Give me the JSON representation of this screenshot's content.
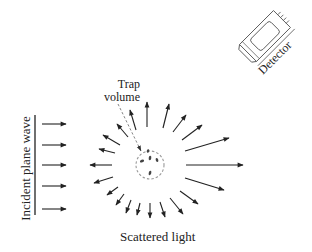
{
  "diagram": {
    "labels": {
      "trap_line1": "Trap",
      "trap_line2": "volume",
      "incident": "Incident plane wave",
      "scattered": "Scattered light",
      "detector": "Detector"
    },
    "colors": {
      "ink": "#222222",
      "dashed": "#888888",
      "background": "#ffffff"
    },
    "trap": {
      "cx": 150,
      "cy": 165,
      "r": 14
    },
    "incident_wave": {
      "wavefront_x": 35,
      "wavefront_y1": 115,
      "wavefront_y2": 215,
      "arrows_y": [
        124,
        145,
        165,
        186,
        209
      ],
      "arrow_x1": 42,
      "arrow_x2": 66
    },
    "scattered_arrows": [
      {
        "x1": 186,
        "y1": 165,
        "x2": 243,
        "y2": 165
      },
      {
        "x1": 185,
        "y1": 151,
        "x2": 229,
        "y2": 138
      },
      {
        "x1": 182,
        "y1": 140,
        "x2": 202,
        "y2": 125
      },
      {
        "x1": 173,
        "y1": 132,
        "x2": 186,
        "y2": 115
      },
      {
        "x1": 163,
        "y1": 128,
        "x2": 169,
        "y2": 104
      },
      {
        "x1": 147,
        "y1": 127,
        "x2": 147,
        "y2": 102
      },
      {
        "x1": 136,
        "y1": 130,
        "x2": 130,
        "y2": 110
      },
      {
        "x1": 128,
        "y1": 137,
        "x2": 117,
        "y2": 124
      },
      {
        "x1": 120,
        "y1": 145,
        "x2": 103,
        "y2": 135
      },
      {
        "x1": 115,
        "y1": 153,
        "x2": 99,
        "y2": 149
      },
      {
        "x1": 112,
        "y1": 165,
        "x2": 90,
        "y2": 165
      },
      {
        "x1": 113,
        "y1": 177,
        "x2": 94,
        "y2": 183
      },
      {
        "x1": 118,
        "y1": 187,
        "x2": 107,
        "y2": 195
      },
      {
        "x1": 124,
        "y1": 194,
        "x2": 116,
        "y2": 205
      },
      {
        "x1": 131,
        "y1": 200,
        "x2": 126,
        "y2": 213
      },
      {
        "x1": 140,
        "y1": 203,
        "x2": 137,
        "y2": 215
      },
      {
        "x1": 150,
        "y1": 203,
        "x2": 150,
        "y2": 218
      },
      {
        "x1": 160,
        "y1": 202,
        "x2": 165,
        "y2": 217
      },
      {
        "x1": 170,
        "y1": 198,
        "x2": 183,
        "y2": 214
      },
      {
        "x1": 180,
        "y1": 191,
        "x2": 198,
        "y2": 204
      },
      {
        "x1": 185,
        "y1": 178,
        "x2": 224,
        "y2": 190
      }
    ],
    "particles": [
      {
        "x": 142,
        "y": 161,
        "rx": 2.2,
        "ry": 1.4,
        "rot": -20
      },
      {
        "x": 150,
        "y": 158,
        "rx": 1.3,
        "ry": 2.2,
        "rot": 10
      },
      {
        "x": 157,
        "y": 160,
        "rx": 1.3,
        "ry": 2.1,
        "rot": -15
      },
      {
        "x": 148,
        "y": 151,
        "rx": 1.2,
        "ry": 1.8,
        "rot": 20
      },
      {
        "x": 150,
        "y": 173,
        "rx": 1.3,
        "ry": 2.2,
        "rot": 15
      }
    ],
    "trap_pointer": {
      "x1": 118,
      "y1": 104,
      "x2": 141,
      "y2": 151
    }
  }
}
